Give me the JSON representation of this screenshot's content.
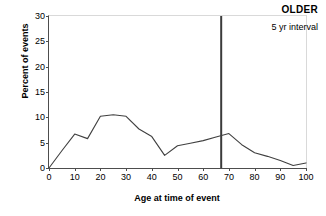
{
  "chart_data": {
    "type": "line",
    "title": "",
    "xlabel": "Age at time of event",
    "ylabel": "Percent of events",
    "xlim": [
      0,
      100
    ],
    "ylim": [
      0,
      30
    ],
    "grid": false,
    "legend": "none",
    "x": [
      0,
      5,
      10,
      15,
      20,
      25,
      30,
      35,
      40,
      45,
      50,
      55,
      60,
      65,
      70,
      75,
      80,
      85,
      90,
      95,
      100
    ],
    "series": [
      {
        "name": "Percent of events",
        "color": "#404040",
        "values": [
          0.0,
          3.4,
          6.7,
          5.8,
          10.2,
          10.5,
          10.2,
          7.7,
          6.2,
          2.5,
          4.4,
          4.9,
          5.4,
          6.1,
          6.8,
          4.6,
          3.0,
          2.3,
          1.5,
          0.5,
          1.0
        ]
      }
    ],
    "xticks": [
      "0",
      "10",
      "20",
      "30",
      "40",
      "50",
      "60",
      "70",
      "80",
      "90",
      "100"
    ],
    "xtick_values": [
      0,
      10,
      20,
      30,
      40,
      50,
      60,
      70,
      80,
      90,
      100
    ],
    "yticks": [
      "0",
      "5",
      "10",
      "15",
      "20",
      "25",
      "30"
    ],
    "ytick_values": [
      0,
      5,
      10,
      15,
      20,
      25,
      30
    ],
    "annotations": [
      {
        "name": "vertical-reference-line",
        "type": "vline",
        "x": 67,
        "color": "#3b3b3b"
      },
      {
        "name": "older-label",
        "type": "text",
        "text": "OLDER",
        "bold": true
      },
      {
        "name": "interval-label",
        "type": "text",
        "text": "5 yr interval",
        "bold": false
      }
    ]
  },
  "labels": {
    "older": "OLDER",
    "interval": "5 yr interval",
    "xlabel": "Age at time of event",
    "ylabel": "Percent of events"
  }
}
